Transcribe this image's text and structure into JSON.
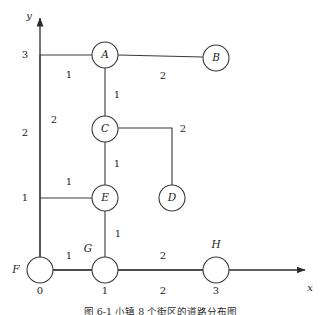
{
  "figure": {
    "caption": "图 6-1   小镇 8 个街区的道路分布图",
    "axes": {
      "x_name": "x",
      "y_name": "y",
      "x_ticks": [
        {
          "label": "0",
          "x": 40
        },
        {
          "label": "1",
          "x": 105
        },
        {
          "label": "2",
          "x": 163
        },
        {
          "label": "3",
          "x": 216
        }
      ],
      "y_ticks": [
        {
          "label": "1",
          "y": 198
        },
        {
          "label": "2",
          "y": 133
        },
        {
          "label": "3",
          "y": 55
        }
      ]
    },
    "nodes": [
      {
        "id": "A",
        "label": "A",
        "cx": 105,
        "cy": 55,
        "r": 13,
        "label_inside": true
      },
      {
        "id": "B",
        "label": "B",
        "cx": 216,
        "cy": 58,
        "r": 13,
        "label_inside": true
      },
      {
        "id": "C",
        "label": "C",
        "cx": 105,
        "cy": 129,
        "r": 13,
        "label_inside": true
      },
      {
        "id": "D",
        "label": "D",
        "cx": 172,
        "cy": 198,
        "r": 13,
        "label_inside": true
      },
      {
        "id": "E",
        "label": "E",
        "cx": 105,
        "cy": 198,
        "r": 13,
        "label_inside": true
      },
      {
        "id": "F",
        "label": "F",
        "cx": 40,
        "cy": 270,
        "r": 13,
        "label_inside": false,
        "label_x": 16,
        "label_y": 270
      },
      {
        "id": "G",
        "label": "G",
        "cx": 105,
        "cy": 270,
        "r": 13,
        "label_inside": false,
        "label_x": 88,
        "label_y": 249
      },
      {
        "id": "H",
        "label": "H",
        "cx": 216,
        "cy": 270,
        "r": 13,
        "label_inside": false,
        "label_x": 216,
        "label_y": 245
      }
    ],
    "edges": [
      {
        "id": "F-A",
        "from": "F",
        "to": "A",
        "weight": "2",
        "path": "M 40,257 L 40,55",
        "label_x": 54,
        "label_y": 120
      },
      {
        "id": "axis-A",
        "from": "y-axis",
        "to": "A",
        "weight": "1",
        "path": "M 40,55 L 92,55",
        "label_x": 69,
        "label_y": 75
      },
      {
        "id": "A-B",
        "from": "A",
        "to": "B",
        "weight": "2",
        "path": "M 118,55 L 203,57",
        "label_x": 163,
        "label_y": 76
      },
      {
        "id": "A-C",
        "from": "A",
        "to": "C",
        "weight": "1",
        "path": "M 105,68 L 105,116",
        "label_x": 117,
        "label_y": 95
      },
      {
        "id": "C-D",
        "from": "C",
        "to": "D",
        "weight": "2",
        "path": "M 118,128 L 172,128 L 172,185",
        "label_x": 183,
        "label_y": 129
      },
      {
        "id": "C-E",
        "from": "C",
        "to": "E",
        "weight": "1",
        "path": "M 105,142 L 105,185",
        "label_x": 117,
        "label_y": 164
      },
      {
        "id": "F-E",
        "from": "F",
        "to": "E",
        "weight": "1",
        "path": "M 40,198 L 92,198",
        "label_x": 69,
        "label_y": 182
      },
      {
        "id": "E-G",
        "from": "E",
        "to": "G",
        "weight": "1",
        "path": "M 105,211 L 105,257",
        "label_x": 118,
        "label_y": 234
      },
      {
        "id": "F-G",
        "from": "F",
        "to": "G",
        "weight": "1",
        "path": "M 40,270 L 92,270",
        "label_x": 69,
        "label_y": 256
      },
      {
        "id": "G-H",
        "from": "G",
        "to": "H",
        "weight": "2",
        "path": "M 118,270 L 203,270",
        "label_x": 163,
        "label_y": 256
      }
    ]
  },
  "colors": {
    "stroke": "#3a3a3a",
    "axis": "#2b2b2b",
    "text": "#1c1c1c",
    "background": "#ffffff"
  }
}
